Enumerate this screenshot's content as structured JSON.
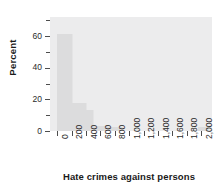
{
  "chart_data": {
    "type": "bar",
    "title": "",
    "subtitle": "",
    "xlabel": "Hate crimes against persons",
    "ylabel": "Percent",
    "xlim": [
      -100,
      2150
    ],
    "ylim": [
      0,
      72
    ],
    "grid": false,
    "legend": null,
    "bin_width": 200,
    "categories": [
      "0",
      "200",
      "400",
      "600",
      "800",
      "1,000",
      "1,200",
      "1,400",
      "1,600",
      "1,800",
      "2,000"
    ],
    "x": [
      0,
      200,
      400,
      600,
      800,
      1000,
      1200,
      1400,
      1600,
      1800,
      2000
    ],
    "values": [
      61,
      18,
      13,
      3,
      2.5,
      0,
      0,
      0,
      0,
      0,
      2.5
    ],
    "bars": [
      {
        "x_start": 0,
        "x_end": 200,
        "value": 61
      },
      {
        "x_start": 200,
        "x_end": 400,
        "value": 18
      },
      {
        "x_start": 400,
        "x_end": 500,
        "value": 13
      },
      {
        "x_start": 500,
        "x_end": 700,
        "value": 3
      },
      {
        "x_start": 700,
        "x_end": 900,
        "value": 2.5
      },
      {
        "x_start": 1950,
        "x_end": 2100,
        "value": 2.5
      }
    ],
    "xticks": [
      {
        "value": 0,
        "label": "0"
      },
      {
        "value": 200,
        "label": "200"
      },
      {
        "value": 400,
        "label": "400"
      },
      {
        "value": 600,
        "label": "600"
      },
      {
        "value": 800,
        "label": "800"
      },
      {
        "value": 1000,
        "label": "1,000"
      },
      {
        "value": 1200,
        "label": "1,200"
      },
      {
        "value": 1400,
        "label": "1,400"
      },
      {
        "value": 1600,
        "label": "1,600"
      },
      {
        "value": 1800,
        "label": "1,800"
      },
      {
        "value": 2000,
        "label": "2,000"
      }
    ],
    "yticks": [
      {
        "value": 0,
        "label": "0",
        "major": true
      },
      {
        "value": 10,
        "label": "",
        "major": false
      },
      {
        "value": 20,
        "label": "20",
        "major": true
      },
      {
        "value": 30,
        "label": "",
        "major": false
      },
      {
        "value": 40,
        "label": "40",
        "major": true
      },
      {
        "value": 50,
        "label": "",
        "major": false
      },
      {
        "value": 60,
        "label": "60",
        "major": true
      },
      {
        "value": 70,
        "label": "",
        "major": false
      }
    ],
    "colors": {
      "plot_background": "#ececed",
      "bar_fill": "#dcdcdd",
      "axis": "#4d4d4d",
      "text": "#1a1a1a",
      "page_background": "#ffffff"
    }
  }
}
